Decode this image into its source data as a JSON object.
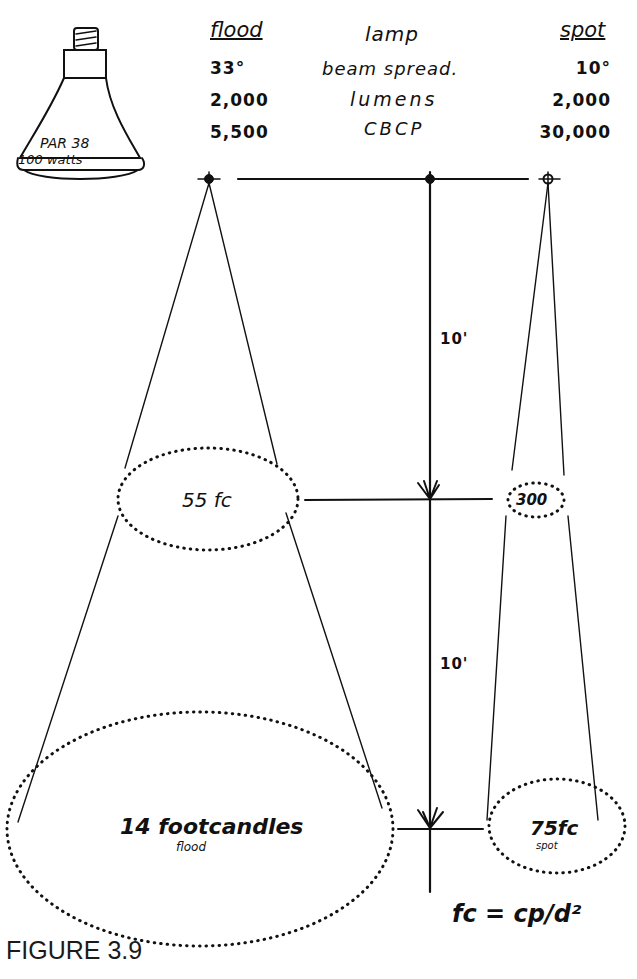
{
  "lamp": {
    "label_line1": "PAR 38",
    "label_line2": "100 watts"
  },
  "table": {
    "headers": {
      "flood": "flood",
      "lamp": "lamp",
      "spot": "spot"
    },
    "rows": [
      {
        "flood": "33°",
        "label": "beam spread.",
        "spot": "10°"
      },
      {
        "flood": "2,000",
        "label": "lumens",
        "spot": "2,000"
      },
      {
        "flood": "5,500",
        "label": "CBCP",
        "spot": "30,000"
      }
    ]
  },
  "diagram": {
    "distance_1": "10'",
    "distance_2": "10'",
    "flood_10ft": "55 fc",
    "spot_10ft": "300",
    "flood_20ft": "14 footcandles",
    "flood_20ft_sub": "flood",
    "spot_20ft": "75fc",
    "spot_20ft_sub": "spot",
    "formula": "fc = cp/d²"
  },
  "caption": "FIGURE 3.9"
}
